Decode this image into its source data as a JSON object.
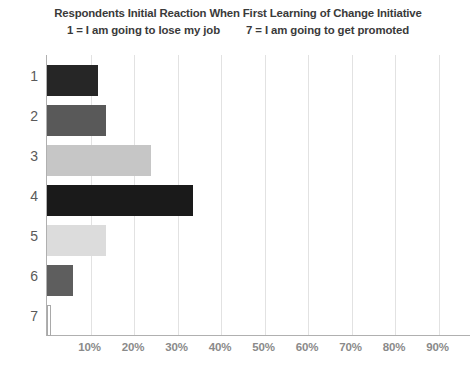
{
  "chart_data": {
    "type": "bar",
    "orientation": "horizontal",
    "title": "Respondents Initial Reaction When First Learning of Change Initiative",
    "subtitle_left": "1 = I am going to lose my job",
    "subtitle_right": "7 = I am going to get promoted",
    "xlabel": "",
    "ylabel": "",
    "categories": [
      "1",
      "2",
      "3",
      "4",
      "5",
      "6",
      "7"
    ],
    "values": [
      11.7,
      13.6,
      23.9,
      33.6,
      13.6,
      6.0,
      1.0
    ],
    "value_labels": [
      "11.7%",
      "13.6%",
      "23.9%",
      "33.6%",
      "13.6%",
      "6.0%",
      "1.0%"
    ],
    "xlim": [
      0,
      100
    ],
    "xticks": [
      10,
      20,
      30,
      40,
      50,
      60,
      70,
      80,
      90
    ],
    "xtick_labels": [
      "10%",
      "20%",
      "30%",
      "40%",
      "50%",
      "60%",
      "70%",
      "80%",
      "90%"
    ],
    "grid": true,
    "legend": false,
    "bar_colors": [
      "#262626",
      "#595959",
      "#c6c6c6",
      "#1a1a1a",
      "#dcdcdc",
      "#5e5e5e",
      "#ffffff"
    ],
    "bar_border_colors": [
      "#262626",
      "#595959",
      "#c6c6c6",
      "#1a1a1a",
      "#dcdcdc",
      "#5e5e5e",
      "#a9a9a9"
    ],
    "axis_color": "#b0b0b0",
    "gridline_color": "#e2e2e2",
    "title_color": "#3a3a3a",
    "tick_label_color": "#8a8a8a",
    "category_label_color": "#5a5a5a"
  }
}
